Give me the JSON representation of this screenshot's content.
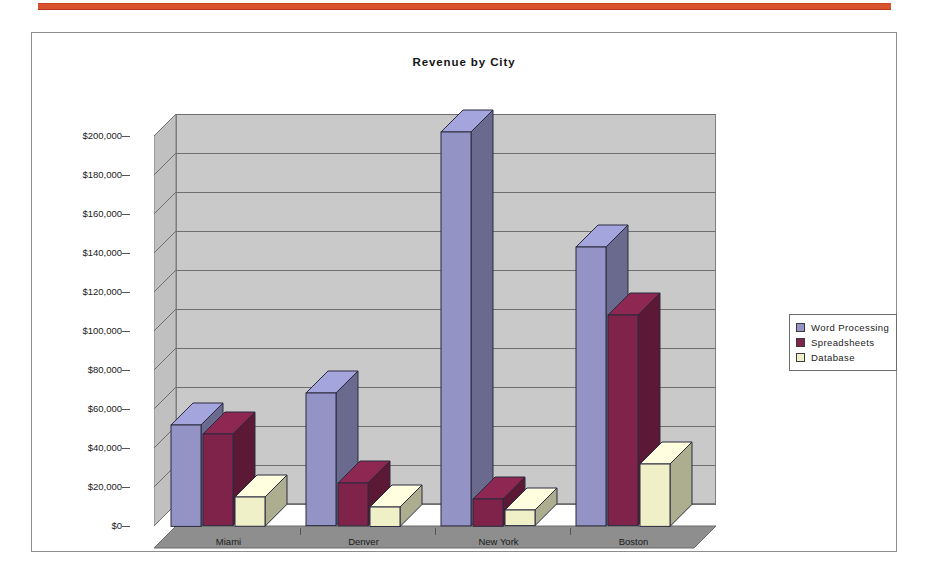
{
  "top_rule": {
    "color": "#d9522e"
  },
  "chart": {
    "title": "Revenue by City",
    "frame_color": "#8d8d8d",
    "plot_background": "#c9c9c9",
    "floor_color": "#8e8e8e",
    "gridline_color": "#6f6f6f"
  },
  "legend": {
    "position": "right",
    "entries": [
      {
        "label": "Word Processing",
        "color": "#9393c6"
      },
      {
        "label": "Spreadsheets",
        "color": "#80234a"
      },
      {
        "label": "Database",
        "color": "#f0f0c8"
      }
    ]
  },
  "chart_data": {
    "type": "bar",
    "title": "Revenue by City",
    "xlabel": "",
    "ylabel": "",
    "ylim": [
      0,
      200000
    ],
    "ytick_step": 20000,
    "grid": true,
    "legend_position": "right",
    "three_d": true,
    "categories": [
      "Miami",
      "Denver",
      "New York",
      "Boston"
    ],
    "ytick_labels": [
      "$0",
      "$20,000",
      "$40,000",
      "$60,000",
      "$80,000",
      "$100,000",
      "$120,000",
      "$140,000",
      "$160,000",
      "$180,000",
      "$200,000"
    ],
    "series": [
      {
        "name": "Word Processing",
        "color": "#9393c6",
        "values": [
          52000,
          68000,
          202000,
          143000
        ]
      },
      {
        "name": "Spreadsheets",
        "color": "#80234a",
        "values": [
          47000,
          22000,
          14000,
          108000
        ]
      },
      {
        "name": "Database",
        "color": "#f0f0c8",
        "values": [
          15000,
          10000,
          8000,
          32000
        ]
      }
    ]
  }
}
